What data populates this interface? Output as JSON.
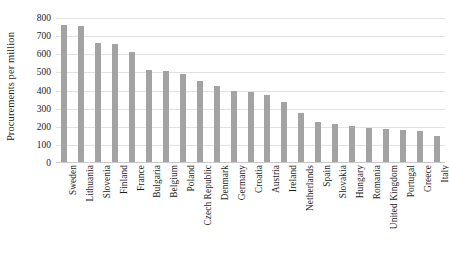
{
  "chart_data": {
    "type": "bar",
    "title": "",
    "xlabel": "",
    "ylabel": "Procurements per million",
    "ylim": [
      0,
      800
    ],
    "ytick_values": [
      0,
      100,
      200,
      300,
      400,
      500,
      600,
      700,
      800
    ],
    "ytick_labels": [
      "0",
      "100",
      "200",
      "300",
      "400",
      "500",
      "600",
      "700",
      "800"
    ],
    "grid": true,
    "legend": null,
    "bar_color": "#a3a3a3",
    "gridline_color": "#e2e2e2",
    "categories": [
      "Sweden",
      "Lithuania",
      "Slovenia",
      "Finland",
      "France",
      "Bulgaria",
      "Belgium",
      "Poland",
      "Czech Republic",
      "Denmark",
      "Germany",
      "Croatia",
      "Austria",
      "Ireland",
      "Netherlands",
      "Spain",
      "Slovakia",
      "Hungary",
      "Romania",
      "United Kingdom",
      "Portugal",
      "Greece",
      "Italy"
    ],
    "values": [
      760,
      757,
      660,
      658,
      610,
      515,
      510,
      490,
      450,
      425,
      400,
      390,
      375,
      335,
      275,
      225,
      215,
      205,
      195,
      185,
      180,
      175,
      150
    ]
  }
}
